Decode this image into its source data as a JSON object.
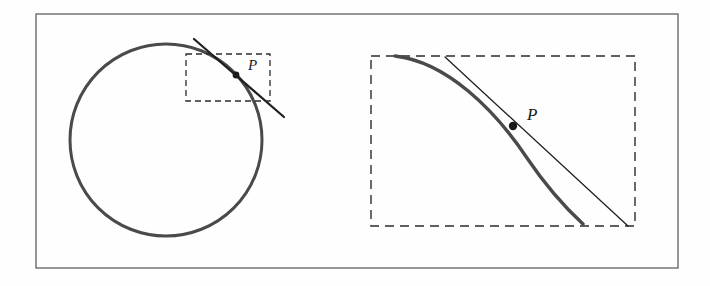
{
  "figure": {
    "name": "tangent-line-to-circle-with-magnified-inset",
    "background_color": "#fefefe",
    "border": {
      "name": "figure-outer-border",
      "color": "#6b6b6b",
      "stroke_width": 1.4,
      "x": 36,
      "y": 14,
      "width": 642,
      "height": 254
    },
    "left_panel": {
      "name": "circle-with-tangent-panel",
      "circle": {
        "label": "circle",
        "center_x": 166,
        "center_y": 140,
        "radius": 96,
        "color": "#4a4a4a",
        "stroke_width": 3.0
      },
      "tangent_line": {
        "label": "tangent line",
        "x1": 194,
        "y1": 39,
        "x2": 284,
        "y2": 117,
        "color": "#1f1f1f",
        "stroke_width": 2.2
      },
      "zoom_box": {
        "label": "magnification region",
        "x": 186,
        "y": 54,
        "width": 84,
        "height": 47,
        "color": "#2b2b2b",
        "stroke_width": 1.3,
        "dash": "6,4"
      },
      "point": {
        "label": "P",
        "x": 236,
        "y": 75,
        "radius": 3.4,
        "color": "#1a1a1a",
        "label_x": 248,
        "label_y": 70,
        "label_size": 15
      }
    },
    "right_panel": {
      "name": "magnified-detail-panel",
      "zoom_box": {
        "label": "magnified region frame",
        "x": 371,
        "y": 56,
        "width": 264,
        "height": 170,
        "color": "#2b2b2b",
        "stroke_width": 1.4,
        "dash": "9,6"
      },
      "curve": {
        "label": "circle arc (magnified)",
        "path": "M 395 56 C 447 62 495 110 527 158 C 550 192 570 212 583 224",
        "color": "#4a4a4a",
        "stroke_width": 3.4
      },
      "tangent_line": {
        "label": "tangent line (magnified)",
        "x1": 445,
        "y1": 57,
        "x2": 628,
        "y2": 226,
        "color": "#1f1f1f",
        "stroke_width": 1.3
      },
      "point": {
        "label": "P",
        "x": 513,
        "y": 126,
        "radius": 4.2,
        "color": "#1a1a1a",
        "label_x": 527,
        "label_y": 120,
        "label_size": 17
      }
    }
  }
}
